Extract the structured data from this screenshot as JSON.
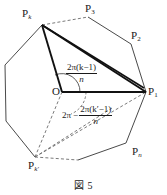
{
  "figure": {
    "caption": "図 5",
    "vertex_labels": [
      {
        "name": "P_k",
        "base": "P",
        "sub": "k",
        "x": 22,
        "y": 8
      },
      {
        "name": "P_3",
        "base": "P",
        "sub": "3",
        "x": 85,
        "y": 3
      },
      {
        "name": "P_2",
        "base": "P",
        "sub": "2",
        "x": 131,
        "y": 30
      },
      {
        "name": "P_1",
        "base": "P",
        "sub": "1",
        "x": 148,
        "y": 86
      },
      {
        "name": "P_n",
        "base": "P",
        "sub": "n",
        "x": 132,
        "y": 146
      },
      {
        "name": "P_k'",
        "base": "P",
        "sub": "k′",
        "x": 28,
        "y": 160
      }
    ],
    "origin_label": "O",
    "angle_expressions": {
      "upper": {
        "numerator": "2π(k−1)",
        "denominator": "n",
        "x": 66,
        "y": 62
      },
      "lower": {
        "lead": "2π",
        "minus": "−",
        "numerator": "2π(k′−1)",
        "denominator": "n",
        "x": 62,
        "y": 104
      }
    },
    "colors": {
      "stroke": "#4a4a4a",
      "bold_stroke": "#111111",
      "dashed_stroke": "#6b6b6b",
      "text": "#1a1a1a",
      "background": "#ffffff"
    },
    "geometry": {
      "polygon_points": "42,25 88,17 131,44 146,92 126,143 78,160 35,157 6,121 5,65",
      "origin": {
        "x": 62,
        "y": 92
      },
      "vertex_Pk": {
        "x": 42,
        "y": 25
      },
      "vertex_P1": {
        "x": 146,
        "y": 92
      },
      "vertex_Pkp": {
        "x": 35,
        "y": 157
      }
    }
  }
}
